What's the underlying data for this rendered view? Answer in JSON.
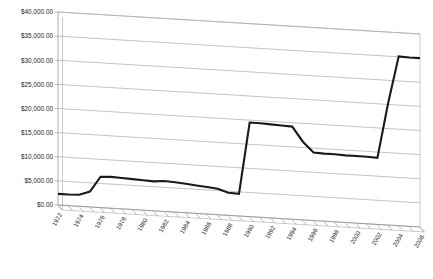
{
  "chart_data": {
    "type": "line",
    "title": "",
    "subtitle": "",
    "xlabel": "",
    "ylabel": "",
    "grid": true,
    "legend": false,
    "legend_position": "none",
    "style": "3d-skewed-plot-area",
    "line_color": "#1a1a1a",
    "gridline_color": "#9a9a9a",
    "background_color": "#ffffff",
    "xlim": [
      1972,
      2006
    ],
    "ylim": [
      0,
      40000
    ],
    "ytick_step": 5000,
    "ytick_labels": [
      "$0.00",
      "$5,000.00",
      "$10,000.00",
      "$15,000.00",
      "$20,000.00",
      "$25,000.00",
      "$30,000.00",
      "$35,000.00",
      "$40,000.00"
    ],
    "ytick_values": [
      0,
      5000,
      10000,
      15000,
      20000,
      25000,
      30000,
      35000,
      40000
    ],
    "xtick_labels": [
      "1972",
      "1974",
      "1976",
      "1978",
      "1980",
      "1982",
      "1984",
      "1986",
      "1988",
      "1990",
      "1992",
      "1994",
      "1996",
      "1998",
      "2000",
      "2002",
      "2004",
      "2006"
    ],
    "xtick_values": [
      1972,
      1974,
      1976,
      1978,
      1980,
      1982,
      1984,
      1986,
      1988,
      1990,
      1992,
      1994,
      1996,
      1998,
      2000,
      2002,
      2004,
      2006
    ],
    "xtick_minor_every": 1,
    "xtick_label_rotation": -60,
    "series": [
      {
        "name": "Amount",
        "x": [
          1972,
          1973,
          1974,
          1975,
          1976,
          1977,
          1978,
          1979,
          1980,
          1981,
          1982,
          1983,
          1984,
          1985,
          1986,
          1987,
          1988,
          1989,
          1990,
          1991,
          1992,
          1993,
          1994,
          1995,
          1996,
          1997,
          1998,
          1999,
          2000,
          2001,
          2002,
          2003,
          2004,
          2005,
          2006
        ],
        "values": [
          2300,
          2300,
          2400,
          3200,
          6400,
          6500,
          6400,
          6300,
          6200,
          6100,
          6300,
          6200,
          6000,
          5800,
          5600,
          5400,
          4700,
          4600,
          19500,
          19500,
          19400,
          19300,
          19200,
          16200,
          14100,
          14000,
          14000,
          13900,
          13900,
          13900,
          13800,
          25200,
          35100,
          35000,
          35000
        ]
      }
    ]
  }
}
